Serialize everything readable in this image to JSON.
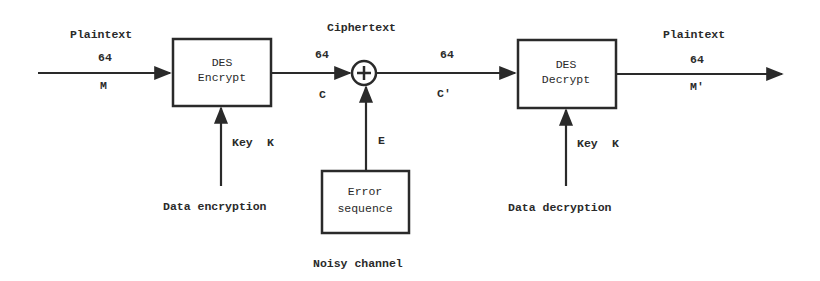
{
  "diagram": {
    "type": "block-diagram",
    "colors": {
      "stroke": "#2a2a2a",
      "background": "#ffffff",
      "text": "#2a2a2a"
    },
    "input": {
      "title": "Plaintext",
      "bits": "64",
      "symbol": "M"
    },
    "encrypt_block": {
      "line1": "DES",
      "line2": "Encrypt",
      "key_label": "Key",
      "key_symbol": "K",
      "caption": "Data encryption"
    },
    "ciphertext": {
      "title": "Ciphertext",
      "bits_in": "64",
      "symbol_in": "C",
      "bits_out": "64",
      "symbol_out": "C'"
    },
    "xor_node": {
      "symbol": "+",
      "input_label": "E"
    },
    "error_block": {
      "line1": "Error",
      "line2": "sequence",
      "caption": "Noisy channel"
    },
    "decrypt_block": {
      "line1": "DES",
      "line2": "Decrypt",
      "key_label": "Key",
      "key_symbol": "K",
      "caption": "Data decryption"
    },
    "output": {
      "title": "Plaintext",
      "bits": "64",
      "symbol": "M'"
    }
  }
}
